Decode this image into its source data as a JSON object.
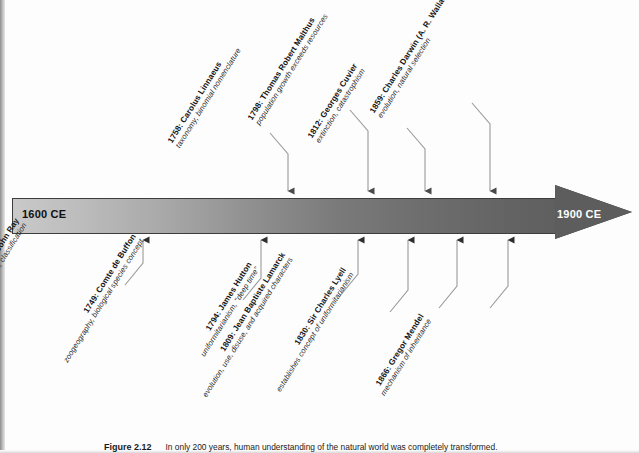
{
  "figure": {
    "number": "Figure 2.12",
    "caption": "In only 200 years, human understanding of the natural world was completely transformed."
  },
  "timeline": {
    "start_label": "1600 CE",
    "end_label": "1900 CE",
    "start_year": 1600,
    "end_year": 1900,
    "direction": "left-to-right",
    "colors": {
      "bar_start": "#c9c9c9",
      "bar_end": "#5f5f5f",
      "outline": "#3d3d3d",
      "leader_line": "#8c8c8c"
    }
  },
  "events_above": [
    {
      "year": "1758",
      "title": "1758: Carolus Linnaeus",
      "desc": "taxonomy, binomial nomenclature",
      "anchor_x": 288
    },
    {
      "year": "1798",
      "title": "1798: Thomas Robert Malthus",
      "desc": "population growth exceeds resources",
      "anchor_x": 368
    },
    {
      "year": "1812",
      "title": "1812: Georges Cuvier",
      "desc": "extinction, catastrophism",
      "anchor_x": 425
    },
    {
      "year": "1859",
      "title": "1859: Charles Darwin (A. R. Wallace)",
      "desc": "evolution, natural selection",
      "anchor_x": 490
    }
  ],
  "events_below": [
    {
      "year": "1691",
      "title": "1691: John Ray",
      "desc": "modern concept of genus and species, classification",
      "anchor_x": 143
    },
    {
      "year": "1749",
      "title": "1749: Comte de Buffon",
      "desc": "zoogeography, biological species concept",
      "anchor_x": 261
    },
    {
      "year": "1794",
      "title": "1794: James Hutton",
      "desc": "uniformitarianism, \"deep time\"",
      "anchor_x": 358
    },
    {
      "year": "1809",
      "title": "1809: Jean Baptiste Lamarck",
      "desc": "evolution, use, disuse, and acquired characters",
      "anchor_x": 408
    },
    {
      "year": "1830",
      "title": "1830: Sir Charles Lyell",
      "desc": "establishes concept of uniformitarianism",
      "anchor_x": 457
    },
    {
      "year": "1866",
      "title": "1866: Gregor Mendel",
      "desc": "mechanism of inheritance",
      "anchor_x": 508
    }
  ]
}
